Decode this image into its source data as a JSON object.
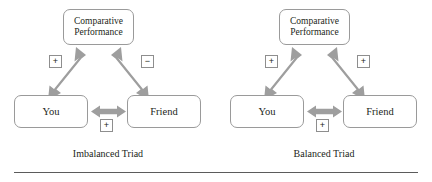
{
  "figure": {
    "arrow_color": "#9e9e9e",
    "box_border_color": "#9a9a9a",
    "text_color": "#231f20",
    "rule_color": "#5b5b5b"
  },
  "panels": [
    {
      "id": "imbalanced",
      "caption": "Imbalanced Triad",
      "nodes": {
        "top": "Comparative\nPerformance",
        "top_line1": "Comparative",
        "top_line2": "Performance",
        "left": "You",
        "right": "Friend"
      },
      "signs": {
        "you_to_performance": "+",
        "friend_to_performance": "−",
        "you_to_friend": "+"
      }
    },
    {
      "id": "balanced",
      "caption": "Balanced Triad",
      "nodes": {
        "top": "Comparative\nPerformance",
        "top_line1": "Comparative",
        "top_line2": "Performance",
        "left": "You",
        "right": "Friend"
      },
      "signs": {
        "you_to_performance": "+",
        "friend_to_performance": "+",
        "you_to_friend": "+"
      }
    }
  ]
}
